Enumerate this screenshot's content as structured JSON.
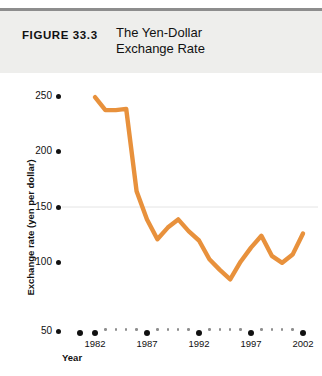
{
  "header": {
    "figure_number": "FIGURE 33.3",
    "title_line1": "The Yen-Dollar",
    "title_line2": "Exchange Rate"
  },
  "colors": {
    "line": "#E8913C",
    "header_band": "#eeeeec",
    "header_rule": "#8d8d8d",
    "text": "#111111",
    "gridline": "#e4e4e4",
    "minor_tick": "#8e8e8e"
  },
  "axes": {
    "y_title": "Exchange rate (yen per dollar)",
    "x_title": "Year",
    "y_ticks": [
      "250",
      "200",
      "150",
      "100",
      "50"
    ],
    "x_ticks": [
      "1982",
      "1987",
      "1992",
      "1997",
      "2002"
    ]
  },
  "chart_data": {
    "type": "line",
    "title": "The Yen-Dollar Exchange Rate",
    "xlabel": "Year",
    "ylabel": "Exchange rate (yen per dollar)",
    "xlim": [
      1981,
      2003
    ],
    "ylim": [
      50,
      265
    ],
    "grid": "single faint horizontal line at 150",
    "legend": "none",
    "x": [
      1982,
      1983,
      1984,
      1985,
      1986,
      1987,
      1988,
      1989,
      1990,
      1991,
      1992,
      1993,
      1994,
      1995,
      1996,
      1997,
      1998,
      1999,
      2000,
      2001,
      2002
    ],
    "series": [
      {
        "name": "Yen per dollar",
        "values": [
          249,
          238,
          238,
          239,
          169,
          145,
          128,
          138,
          145,
          135,
          127,
          111,
          102,
          94,
          109,
          121,
          131,
          114,
          108,
          115,
          133
        ]
      }
    ]
  }
}
